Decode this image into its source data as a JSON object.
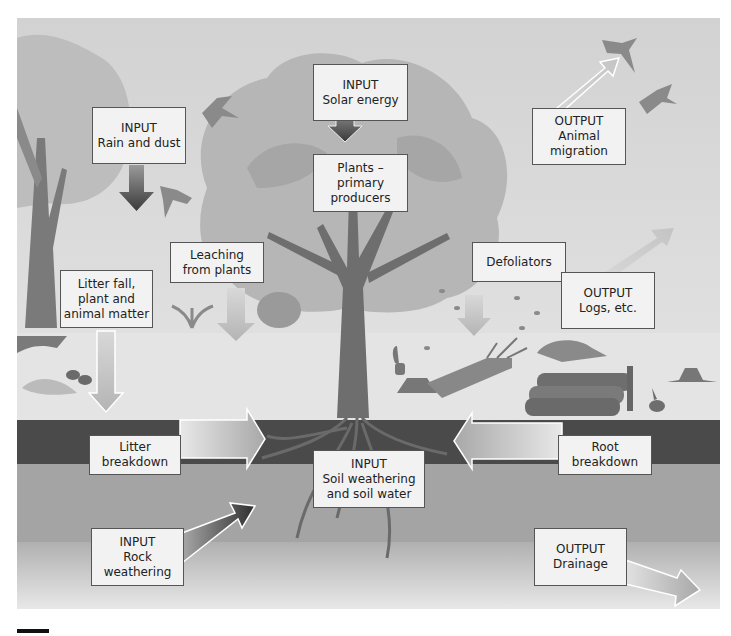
{
  "diagram": {
    "colors": {
      "sky": "#d2d2d2",
      "ground_surface": "#e4e4e4",
      "topsoil": "#4a4a4a",
      "subsoil": "#a4a4a4",
      "box_fill": "#f2f2f2",
      "box_border": "#555555"
    },
    "labels": {
      "rain_dust": {
        "line1": "INPUT",
        "line2": "Rain and dust"
      },
      "solar": {
        "line1": "INPUT",
        "line2": "Solar energy"
      },
      "plants": {
        "line1": "Plants –",
        "line2": "primary",
        "line3": "producers"
      },
      "migration": {
        "line1": "OUTPUT",
        "line2": "Animal",
        "line3": "migration"
      },
      "leaching": {
        "line1": "Leaching",
        "line2": "from plants"
      },
      "defoliators": {
        "line1": "Defoliators"
      },
      "litter_fall": {
        "line1": "Litter fall,",
        "line2": "plant and",
        "line3": "animal matter"
      },
      "logs": {
        "line1": "OUTPUT",
        "line2": "Logs, etc."
      },
      "litter_breakdown": {
        "line1": "Litter",
        "line2": "breakdown"
      },
      "soil_weathering": {
        "line1": "INPUT",
        "line2": "Soil weathering",
        "line3": "and soil water"
      },
      "root_breakdown": {
        "line1": "Root",
        "line2": "breakdown"
      },
      "rock_weathering": {
        "line1": "INPUT",
        "line2": "Rock",
        "line3": "weathering"
      },
      "drainage": {
        "line1": "OUTPUT",
        "line2": "Drainage"
      }
    },
    "icons": [
      "bird-icon",
      "tree-icon",
      "rabbit-icon",
      "squirrel-icon",
      "fox-icon",
      "log-pile-icon",
      "stump-icon",
      "fallen-tree-icon",
      "roots-icon",
      "shrub-icon",
      "leaves-icon"
    ]
  }
}
